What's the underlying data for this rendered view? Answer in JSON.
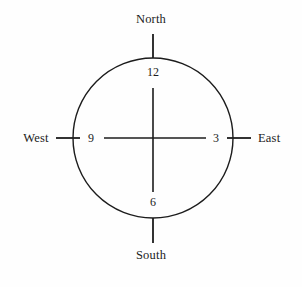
{
  "figure": {
    "background_color": "#fefefe",
    "stroke_color": "#1c1c1c",
    "text_color": "#1c1c1c"
  },
  "compass": {
    "north": "North",
    "south": "South",
    "west": "West",
    "east": "East"
  },
  "clock": {
    "twelve": "12",
    "three": "3",
    "six": "6",
    "nine": "9"
  },
  "geometry": {
    "center_x": 153,
    "center_y": 138,
    "radius": 80
  }
}
